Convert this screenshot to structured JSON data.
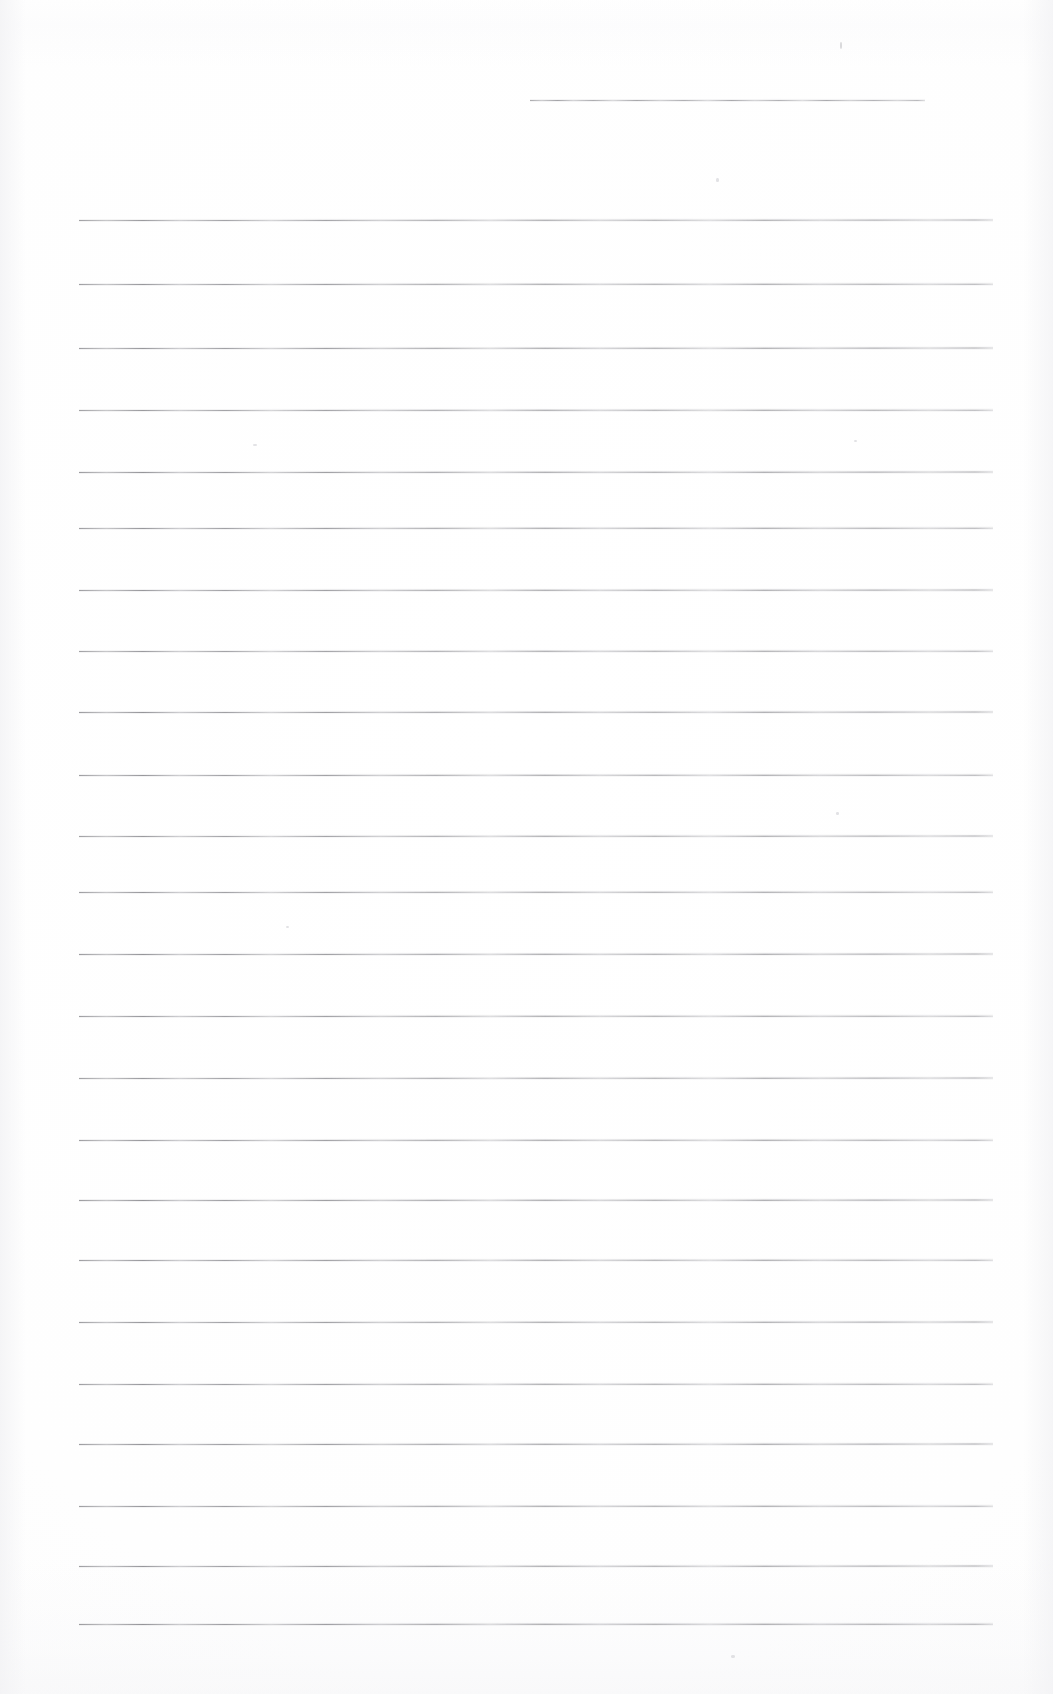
{
  "document": {
    "kind": "scanned-blank-ruled-page",
    "page_width": 1053,
    "page_height": 1694,
    "background_color": "#ffffff",
    "paper_tone": "#fdfdfd",
    "rule_color": "#8a8a8e",
    "text_content": "",
    "handwriting_present": "none",
    "visible_text_blocks": []
  },
  "rules": {
    "count": 24,
    "color": "#8a8a8e",
    "thickness_px": 1,
    "nominal_spacing_px": 64,
    "full_line_left_x": 79,
    "full_line_right_x": 993,
    "first_line_is_partial": "yes",
    "lines": [
      {
        "index": 1,
        "y": 100,
        "x1": 530,
        "x2": 925,
        "partial": true,
        "slope": -0.4,
        "opacity": 0.7
      },
      {
        "index": 2,
        "y": 220,
        "x1": 79,
        "x2": 993,
        "partial": false,
        "slope": -0.6,
        "opacity": 0.78
      },
      {
        "index": 3,
        "y": 284,
        "x1": 79,
        "x2": 993,
        "partial": false,
        "slope": -0.5,
        "opacity": 0.8
      },
      {
        "index": 4,
        "y": 348,
        "x1": 79,
        "x2": 993,
        "partial": false,
        "slope": -0.6,
        "opacity": 0.8
      },
      {
        "index": 5,
        "y": 410,
        "x1": 79,
        "x2": 993,
        "partial": false,
        "slope": -0.5,
        "opacity": 0.78
      },
      {
        "index": 6,
        "y": 472,
        "x1": 79,
        "x2": 993,
        "partial": false,
        "slope": -0.6,
        "opacity": 0.82
      },
      {
        "index": 7,
        "y": 528,
        "x1": 79,
        "x2": 993,
        "partial": false,
        "slope": -0.5,
        "opacity": 0.8
      },
      {
        "index": 8,
        "y": 590,
        "x1": 79,
        "x2": 993,
        "partial": false,
        "slope": -0.6,
        "opacity": 0.8
      },
      {
        "index": 9,
        "y": 651,
        "x1": 79,
        "x2": 993,
        "partial": false,
        "slope": -0.5,
        "opacity": 0.78
      },
      {
        "index": 10,
        "y": 712,
        "x1": 79,
        "x2": 993,
        "partial": false,
        "slope": -0.6,
        "opacity": 0.82
      },
      {
        "index": 11,
        "y": 775,
        "x1": 79,
        "x2": 993,
        "partial": false,
        "slope": -0.5,
        "opacity": 0.8
      },
      {
        "index": 12,
        "y": 836,
        "x1": 79,
        "x2": 993,
        "partial": false,
        "slope": -0.6,
        "opacity": 0.78
      },
      {
        "index": 13,
        "y": 892,
        "x1": 79,
        "x2": 993,
        "partial": false,
        "slope": -0.5,
        "opacity": 0.8
      },
      {
        "index": 14,
        "y": 954,
        "x1": 79,
        "x2": 993,
        "partial": false,
        "slope": -0.6,
        "opacity": 0.82
      },
      {
        "index": 15,
        "y": 1016,
        "x1": 79,
        "x2": 993,
        "partial": false,
        "slope": -0.5,
        "opacity": 0.8
      },
      {
        "index": 16,
        "y": 1078,
        "x1": 79,
        "x2": 993,
        "partial": false,
        "slope": -0.6,
        "opacity": 0.78
      },
      {
        "index": 17,
        "y": 1140,
        "x1": 79,
        "x2": 993,
        "partial": false,
        "slope": -0.5,
        "opacity": 0.8
      },
      {
        "index": 18,
        "y": 1200,
        "x1": 79,
        "x2": 993,
        "partial": false,
        "slope": -0.6,
        "opacity": 0.82
      },
      {
        "index": 19,
        "y": 1260,
        "x1": 79,
        "x2": 993,
        "partial": false,
        "slope": -0.5,
        "opacity": 0.8
      },
      {
        "index": 20,
        "y": 1322,
        "x1": 79,
        "x2": 993,
        "partial": false,
        "slope": -0.6,
        "opacity": 0.8
      },
      {
        "index": 21,
        "y": 1384,
        "x1": 79,
        "x2": 993,
        "partial": false,
        "slope": -0.5,
        "opacity": 0.8
      },
      {
        "index": 22,
        "y": 1444,
        "x1": 79,
        "x2": 993,
        "partial": false,
        "slope": -0.6,
        "opacity": 0.82
      },
      {
        "index": 23,
        "y": 1506,
        "x1": 79,
        "x2": 993,
        "partial": false,
        "slope": -0.5,
        "opacity": 0.8
      },
      {
        "index": 24,
        "y": 1566,
        "x1": 79,
        "x2": 993,
        "partial": false,
        "slope": -0.6,
        "opacity": 0.8
      },
      {
        "index": 25,
        "y": 1624,
        "x1": 79,
        "x2": 993,
        "partial": false,
        "slope": -0.5,
        "opacity": 0.82
      }
    ]
  },
  "specks": [
    {
      "x": 840,
      "y": 42,
      "w": 2,
      "h": 7,
      "class": "faint"
    },
    {
      "x": 716,
      "y": 178,
      "w": 3,
      "h": 4,
      "class": "vfaint"
    },
    {
      "x": 253,
      "y": 444,
      "w": 4,
      "h": 2,
      "class": "vfaint"
    },
    {
      "x": 854,
      "y": 440,
      "w": 3,
      "h": 2,
      "class": "vfaint"
    },
    {
      "x": 836,
      "y": 812,
      "w": 3,
      "h": 3,
      "class": "vfaint"
    },
    {
      "x": 286,
      "y": 926,
      "w": 3,
      "h": 2,
      "class": "vfaint"
    },
    {
      "x": 731,
      "y": 1655,
      "w": 4,
      "h": 3,
      "class": "vfaint"
    }
  ]
}
